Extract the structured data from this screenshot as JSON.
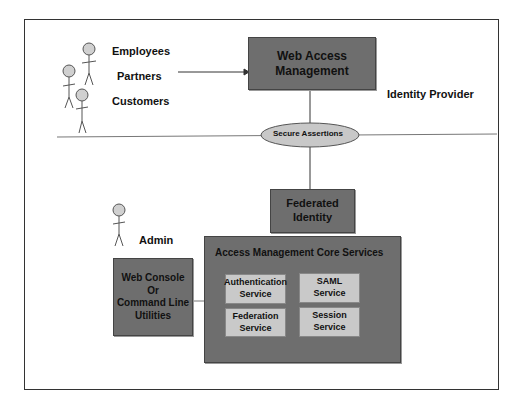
{
  "actors": {
    "employees": "Employees",
    "partners": "Partners",
    "customers": "Customers",
    "admin": "Admin"
  },
  "boxes": {
    "web_access_management": "Web Access\nManagement",
    "federated_identity": "Federated\nIdentity",
    "web_console": "Web Console\nOr\nCommand Line\nUtilities",
    "core_services_title": "Access Management Core Services"
  },
  "services": [
    {
      "label": "Authentication\nService"
    },
    {
      "label": "SAML\nService"
    },
    {
      "label": "Federation\nService"
    },
    {
      "label": "Session\nService"
    }
  ],
  "labels": {
    "identity_provider": "Identity Provider",
    "secure_assertions": "Secure Assertions"
  },
  "colors": {
    "dark_box": "#6e6e6e",
    "light_box": "#c9c9c9",
    "actor_head": "#d0d0d0"
  }
}
